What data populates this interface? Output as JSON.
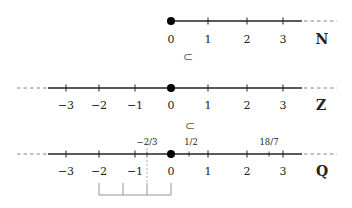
{
  "diagram": {
    "title": "",
    "style": {
      "line_color": "#222222",
      "dash_color": "#777777",
      "point_color": "#000000",
      "bracket_color": "#888888",
      "background": "#ffffff"
    },
    "axis_scale": {
      "origin_x": 171,
      "unit_px": 37.3
    },
    "number_lines": [
      {
        "id": "naturals",
        "set_symbol": "N",
        "y": 21,
        "range": [
          0,
          3
        ],
        "extends_left": false,
        "extends_right": true,
        "marked_point": 0,
        "integer_labels": [
          "0",
          "1",
          "2",
          "3"
        ],
        "fraction_labels": []
      },
      {
        "id": "integers",
        "set_symbol": "Z",
        "y": 88,
        "range": [
          -3,
          3
        ],
        "extends_left": true,
        "extends_right": true,
        "marked_point": 0,
        "integer_labels": [
          "−3",
          "−2",
          "−1",
          "0",
          "1",
          "2",
          "3"
        ],
        "fraction_labels": []
      },
      {
        "id": "rationals",
        "set_symbol": "Q",
        "y": 154,
        "range": [
          -3,
          3
        ],
        "extends_left": true,
        "extends_right": true,
        "marked_point": 0,
        "integer_labels": [
          "−3",
          "−2",
          "−1",
          "0",
          "1",
          "2",
          "3"
        ],
        "fraction_labels": [
          "−2/3",
          "1/2",
          "18/7"
        ]
      }
    ],
    "subset_symbols": [
      "⊂",
      "⊂"
    ],
    "bracket": {
      "description": "interval from −2 to 0 divided into thirds",
      "divisions": [
        -2,
        -1.3333,
        -0.6667,
        0
      ]
    }
  }
}
